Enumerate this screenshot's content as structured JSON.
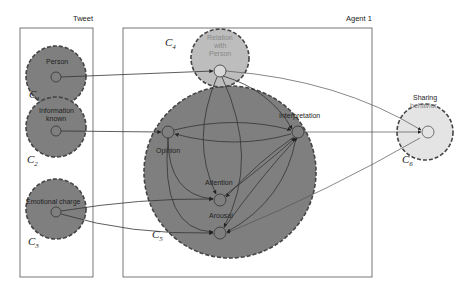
{
  "diagram": {
    "boxes": {
      "tweet": {
        "title": "Tweet"
      },
      "agent": {
        "title": "Agent 1"
      }
    },
    "clusters": [
      {
        "id": "C1",
        "letter": "C",
        "sub": "1",
        "node_label": "Person",
        "fill": "#7f7f7f"
      },
      {
        "id": "C2",
        "letter": "C",
        "sub": "2",
        "node_label_line1": "Information",
        "node_label_line2": "known",
        "fill": "#7f7f7f"
      },
      {
        "id": "C3",
        "letter": "C",
        "sub": "3",
        "node_label": "Emotional charge",
        "fill": "#7f7f7f"
      },
      {
        "id": "C4",
        "letter": "C",
        "sub": "4",
        "node_label_line1": "Relation",
        "node_label_line2": "with",
        "node_label_line3": "Person",
        "fill": "#bdbdbd"
      },
      {
        "id": "C5",
        "letter": "C",
        "sub": "5",
        "fill": "#7f7f7f"
      },
      {
        "id": "C6",
        "letter": "C",
        "sub": "6",
        "node_label_line1": "Sharing",
        "node_label_line2": "behavior",
        "fill": "#e4e4e4"
      }
    ],
    "nodes": {
      "opinion": "Opinion",
      "interpretation": "Interpretation",
      "attention": "Attention",
      "arousal": "Arousal"
    }
  }
}
